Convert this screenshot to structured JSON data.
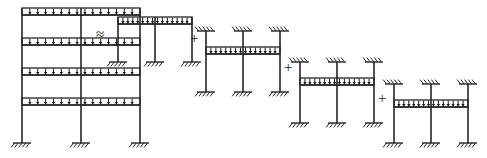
{
  "figure": {
    "domain_hint": "structural-analysis-diagram",
    "stroke_color": "#262626",
    "background_color": "#ffffff",
    "load_arrow_color": "#1a1a1a"
  },
  "operators": [
    {
      "id": "approx",
      "symbol": "≈",
      "x": 96,
      "y": 27,
      "meaning": "approximately-equals"
    },
    {
      "id": "plus1",
      "symbol": "+",
      "x": 190,
      "y": 31,
      "meaning": "plus"
    },
    {
      "id": "plus2",
      "symbol": "+",
      "x": 284,
      "y": 60,
      "meaning": "plus"
    },
    {
      "id": "plus3",
      "symbol": "+",
      "x": 378,
      "y": 91,
      "meaning": "plus"
    }
  ],
  "frames": [
    {
      "id": "full-frame",
      "name": "four-story-loaded-frame",
      "origin_x": 22,
      "origin_y": 8,
      "bay_width": 59,
      "bays": 2,
      "story_height": 30,
      "stories": 4,
      "base_y": 143,
      "columns": 3,
      "top_supports": false,
      "bottom_supports": true,
      "loaded_levels": [
        0,
        1,
        2,
        3
      ],
      "loaded_level_count": 4,
      "arrows_per_bay": 7,
      "beam_depth": 7
    },
    {
      "id": "sub-frame-1",
      "name": "story-1-isolated-substructure",
      "origin_x": 118,
      "origin_y": 17,
      "bay_width": 37,
      "bays": 2,
      "story_height": 32,
      "stories": 1,
      "base_y": 62,
      "columns": 3,
      "top_supports": false,
      "bottom_supports": true,
      "loaded_levels": [
        0
      ],
      "loaded_level_count": 1,
      "arrows_per_bay": 7,
      "beam_depth": 7
    },
    {
      "id": "sub-frame-2",
      "name": "story-2-isolated-substructure",
      "origin_x": 206,
      "origin_y": 47,
      "bay_width": 37,
      "bays": 2,
      "story_height": 32,
      "stories": 1,
      "base_y": 92,
      "columns": 3,
      "top_supports": true,
      "bottom_supports": true,
      "loaded_levels": [
        0
      ],
      "loaded_level_count": 1,
      "arrows_per_bay": 7,
      "beam_depth": 7
    },
    {
      "id": "sub-frame-3",
      "name": "story-3-isolated-substructure",
      "origin_x": 300,
      "origin_y": 78,
      "bay_width": 37,
      "bays": 2,
      "story_height": 32,
      "stories": 1,
      "base_y": 123,
      "columns": 3,
      "top_supports": true,
      "bottom_supports": true,
      "loaded_levels": [
        0
      ],
      "loaded_level_count": 1,
      "arrows_per_bay": 7,
      "beam_depth": 7
    },
    {
      "id": "sub-frame-4",
      "name": "story-4-isolated-substructure",
      "origin_x": 394,
      "origin_y": 100,
      "bay_width": 37,
      "bays": 2,
      "story_height": 30,
      "stories": 1,
      "base_y": 143,
      "columns": 3,
      "top_supports": true,
      "bottom_supports": true,
      "loaded_levels": [
        0
      ],
      "loaded_level_count": 1,
      "arrows_per_bay": 7,
      "beam_depth": 7
    }
  ]
}
